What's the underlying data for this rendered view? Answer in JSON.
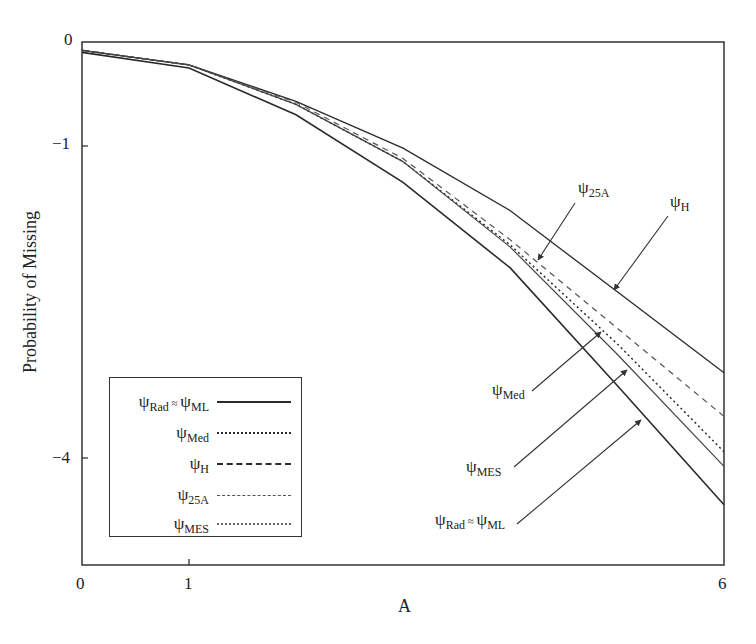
{
  "chart_data": {
    "type": "line",
    "title": "",
    "xlabel": "A",
    "ylabel": "Probability of Missing",
    "xlim": [
      0,
      6
    ],
    "ylim": [
      -5,
      0
    ],
    "x_ticks": [
      "0",
      "1",
      "6"
    ],
    "y_ticks": [
      "0",
      "-1",
      "-4"
    ],
    "grid": false,
    "legend_position": "lower-left inside",
    "x": [
      0,
      1,
      2,
      3,
      4,
      5,
      6
    ],
    "series": [
      {
        "name": "ψRad ≈ ψML",
        "style": "solid",
        "values": [
          -0.1,
          -0.25,
          -0.7,
          -1.35,
          -2.17,
          -3.3,
          -4.45
        ]
      },
      {
        "name": "ψMed",
        "style": "dotted",
        "values": [
          -0.08,
          -0.22,
          -0.6,
          -1.15,
          -1.95,
          -2.9,
          -3.94
        ]
      },
      {
        "name": "ψH",
        "style": "dash-dot",
        "values": [
          -0.08,
          -0.22,
          -0.57,
          -1.02,
          -1.62,
          -2.4,
          -3.18
        ]
      },
      {
        "name": "ψ25A",
        "style": "dashed",
        "values": [
          -0.08,
          -0.22,
          -0.58,
          -1.12,
          -1.9,
          -2.75,
          -3.6
        ]
      },
      {
        "name": "ψMES",
        "style": "fine-dotted",
        "values": [
          -0.08,
          -0.22,
          -0.6,
          -1.15,
          -1.97,
          -3.0,
          -4.08
        ]
      }
    ],
    "annotations": [
      {
        "text": "ψ25A",
        "points_to": "ψ25A"
      },
      {
        "text": "ψH",
        "points_to": "ψH"
      },
      {
        "text": "ψMed",
        "points_to": "ψMed"
      },
      {
        "text": "ψMES",
        "points_to": "ψMES"
      },
      {
        "text": "ψRad ≈ ψML",
        "points_to": "ψRad ≈ ψML"
      }
    ]
  },
  "axes": {
    "xlabel": "A",
    "ylabel": "Probability of Missing",
    "x_tick_labels": [
      "0",
      "1",
      "6"
    ],
    "y_tick_labels": [
      "0",
      "−1",
      "−4"
    ]
  },
  "legend": {
    "items": [
      {
        "psi": "ψ",
        "sub": "Rad",
        "approx": " ≈ ",
        "psi2": "ψ",
        "sub2": "ML"
      },
      {
        "psi": "ψ",
        "sub": "Med"
      },
      {
        "psi": "ψ",
        "sub": "H"
      },
      {
        "psi": "ψ",
        "sub": "25A"
      },
      {
        "psi": "ψ",
        "sub": "MES"
      }
    ]
  },
  "annotations": {
    "a25": {
      "psi": "ψ",
      "sub": "25A"
    },
    "h": {
      "psi": "ψ",
      "sub": "H"
    },
    "med": {
      "psi": "ψ",
      "sub": "Med"
    },
    "mes": {
      "psi": "ψ",
      "sub": "MES"
    },
    "ml": {
      "psi": "ψ",
      "sub": "Rad",
      "approx": " ≈ ",
      "psi2": "ψ",
      "sub2": "ML"
    }
  },
  "colors": {
    "line": "#2a2a2a",
    "axis": "#333333"
  }
}
